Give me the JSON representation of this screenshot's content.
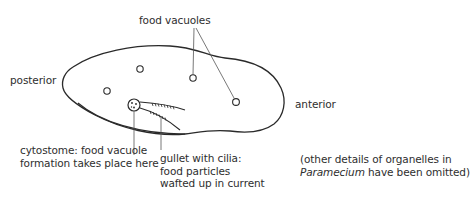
{
  "diagram": {
    "subject": "Paramecium",
    "labels": {
      "food_vacuoles": "food vacuoles",
      "posterior": "posterior",
      "anterior": "anterior",
      "cytostome": {
        "line1": "cytostome: food vacuole",
        "line2": "formation takes place here"
      },
      "gullet": {
        "line1": "gullet with cilia:",
        "line2": "food particles",
        "line3": "wafted up in current"
      },
      "note": {
        "line1": "(other details of organelles in",
        "line2_italic": "Paramecium",
        "line2_rest": " have been omitted)"
      }
    },
    "parts": [
      {
        "name": "cell-body-outline",
        "label": "Paramecium cell body"
      },
      {
        "name": "food-vacuole",
        "count": 4
      },
      {
        "name": "cytostome",
        "label": "cytostome"
      },
      {
        "name": "gullet",
        "label": "gullet with cilia"
      }
    ],
    "colors": {
      "stroke": "#2a2a2a",
      "text": "#2e2e2e",
      "background": "#ffffff"
    }
  }
}
